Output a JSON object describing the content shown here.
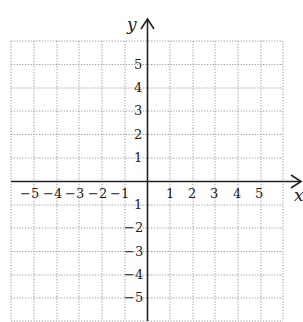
{
  "diagram": {
    "type": "coordinate-plane",
    "x_axis": {
      "label": "x",
      "range": [
        -6,
        6
      ],
      "tick_labels": [
        "-5",
        "-4",
        "-3",
        "-2",
        "-1",
        "1",
        "2",
        "3",
        "4",
        "5"
      ]
    },
    "y_axis": {
      "label": "y",
      "range": [
        -6,
        6
      ],
      "tick_labels": [
        "5",
        "4",
        "3",
        "2",
        "1",
        "-1",
        "-2",
        "-3",
        "-4",
        "-5"
      ]
    },
    "grid": {
      "style": "dotted",
      "color": "#9a9a9a",
      "columns": 12,
      "rows": 12
    },
    "axis_color": "#222222"
  },
  "labels": {
    "x": "x",
    "y": "y",
    "xn5": "−5",
    "xn4": "−4",
    "xn3": "−3",
    "xn2": "−2",
    "xn1": "−1",
    "xp1": "1",
    "xp2": "2",
    "xp3": "3",
    "xp4": "4",
    "xp5": "5",
    "yp5": "5",
    "yp4": "4",
    "yp3": "3",
    "yp2": "2",
    "yp1": "1",
    "yn1": "1",
    "yn2": "−2",
    "yn3": "−3",
    "yn4": "−4",
    "yn5": "−5"
  }
}
